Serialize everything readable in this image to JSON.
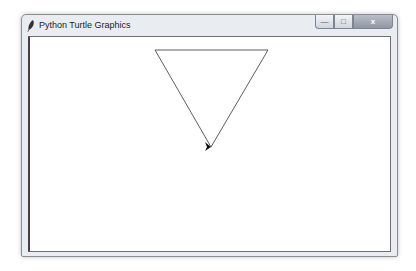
{
  "window": {
    "title": "Python Turtle Graphics",
    "title_icon": "feather-icon",
    "controls": {
      "minimize": "—",
      "maximize": "□",
      "close": "x"
    }
  },
  "canvas": {
    "background": "#ffffff",
    "triangle": {
      "points": [
        [
          155,
          50
        ],
        [
          268,
          50
        ],
        [
          211,
          147
        ]
      ],
      "stroke": "#333333"
    },
    "turtle": {
      "shape": "arrow",
      "x": 211,
      "y": 147,
      "heading": "right",
      "color": "#111111"
    }
  }
}
